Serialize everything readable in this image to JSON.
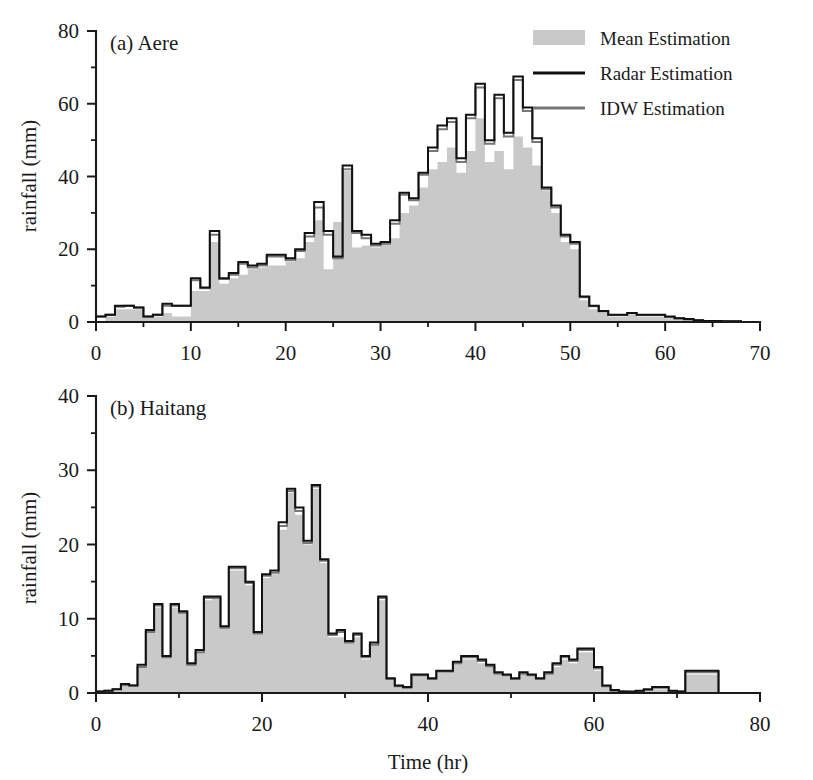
{
  "figure": {
    "width": 813,
    "height": 780,
    "background": "#ffffff",
    "shared_xlabel": "Time (hr)"
  },
  "legend": {
    "position": "top-right-of-panel-a",
    "entries": [
      {
        "label": "Mean Estimation",
        "marker": "filled-swatch",
        "color": "#c9c9c9"
      },
      {
        "label": "Radar Estimation",
        "marker": "line",
        "color": "#111111"
      },
      {
        "label": "IDW Estimation",
        "marker": "line",
        "color": "#777777"
      }
    ]
  },
  "chart_data": [
    {
      "type": "area",
      "panel": "a",
      "title": "(a) Aere",
      "xlabel": "",
      "ylabel": "rainfall (mm)",
      "xlim": [
        0,
        70
      ],
      "ylim": [
        0,
        80
      ],
      "xticks": [
        0,
        10,
        20,
        30,
        40,
        50,
        60,
        70
      ],
      "yticks": [
        0,
        20,
        40,
        60,
        80
      ],
      "xminor_step": 5,
      "yminor_step": 10,
      "grid": false,
      "x": [
        1,
        2,
        3,
        4,
        5,
        6,
        7,
        8,
        9,
        10,
        11,
        12,
        13,
        14,
        15,
        16,
        17,
        18,
        19,
        20,
        21,
        22,
        23,
        24,
        25,
        26,
        27,
        28,
        29,
        30,
        31,
        32,
        33,
        34,
        35,
        36,
        37,
        38,
        39,
        40,
        41,
        42,
        43,
        44,
        45,
        46,
        47,
        48,
        49,
        50,
        51,
        52,
        53,
        54,
        55,
        56,
        57,
        58,
        59,
        60,
        61,
        62,
        63,
        64,
        65,
        66,
        67,
        68,
        69,
        70
      ],
      "series": [
        {
          "name": "Mean Estimation",
          "values": [
            0,
            1.5,
            3.5,
            3.5,
            3.5,
            1.5,
            1.5,
            2.5,
            1.5,
            1.5,
            8.5,
            8.5,
            22.0,
            10.5,
            12.0,
            13.0,
            14.5,
            15.0,
            15.5,
            15.5,
            16.5,
            17.5,
            22.0,
            28.0,
            14.5,
            27.5,
            41.5,
            20.5,
            21.0,
            20.5,
            21.5,
            23.0,
            30.0,
            32.0,
            37.0,
            42.0,
            44.0,
            48.0,
            41.0,
            47.0,
            56.0,
            44.0,
            47.0,
            42.0,
            51.0,
            48.0,
            43.0,
            36.0,
            30.0,
            22.0,
            20.0,
            6.0,
            3.5,
            2.5,
            1.5,
            1.5,
            2.0,
            1.5,
            1.5,
            1.5,
            1.0,
            0.8,
            0.5,
            0.3,
            0.2,
            0.2,
            0.1,
            0.1,
            0.0,
            0.0
          ]
        },
        {
          "name": "Radar Estimation",
          "values": [
            1.5,
            2.0,
            4.5,
            4.5,
            4.0,
            1.5,
            2.0,
            5.0,
            4.5,
            4.5,
            12.0,
            9.5,
            25.0,
            12.0,
            13.5,
            16.5,
            15.5,
            16.0,
            18.5,
            18.5,
            17.5,
            20.0,
            24.5,
            33.0,
            25.0,
            18.0,
            43.0,
            25.0,
            24.0,
            21.5,
            22.0,
            28.0,
            35.5,
            34.0,
            41.0,
            48.0,
            54.0,
            56.0,
            45.0,
            57.0,
            65.5,
            50.0,
            62.5,
            52.0,
            67.5,
            59.0,
            50.5,
            37.0,
            32.0,
            24.0,
            22.0,
            7.0,
            4.5,
            3.0,
            2.0,
            2.0,
            2.5,
            2.0,
            2.0,
            2.0,
            1.5,
            1.0,
            0.8,
            0.5,
            0.3,
            0.3,
            0.2,
            0.2,
            0.0,
            0.0
          ]
        },
        {
          "name": "IDW Estimation",
          "values": [
            1.5,
            2.0,
            4.2,
            4.5,
            4.0,
            1.5,
            2.0,
            4.5,
            4.5,
            4.5,
            11.5,
            9.3,
            24.0,
            11.8,
            13.0,
            16.0,
            15.0,
            15.5,
            18.0,
            18.0,
            17.0,
            19.5,
            23.5,
            31.5,
            24.0,
            17.5,
            42.0,
            24.5,
            23.0,
            21.0,
            21.5,
            27.0,
            35.0,
            33.5,
            40.5,
            47.0,
            53.0,
            55.0,
            44.0,
            56.0,
            64.5,
            49.0,
            61.5,
            51.0,
            66.5,
            58.0,
            49.5,
            36.5,
            31.5,
            23.5,
            21.5,
            6.8,
            4.3,
            2.9,
            1.9,
            1.9,
            2.4,
            1.9,
            1.9,
            1.9,
            1.4,
            1.0,
            0.7,
            0.5,
            0.3,
            0.3,
            0.2,
            0.2,
            0.0,
            0.0
          ]
        }
      ]
    },
    {
      "type": "area",
      "panel": "b",
      "title": "(b) Haitang",
      "xlabel": "Time (hr)",
      "ylabel": "rainfall (mm)",
      "xlim": [
        0,
        80
      ],
      "ylim": [
        0,
        40
      ],
      "xticks": [
        0,
        20,
        40,
        60,
        80
      ],
      "yticks": [
        0,
        10,
        20,
        30,
        40
      ],
      "xminor_step": 10,
      "yminor_step": 5,
      "grid": false,
      "x": [
        1,
        2,
        3,
        4,
        5,
        6,
        7,
        8,
        9,
        10,
        11,
        12,
        13,
        14,
        15,
        16,
        17,
        18,
        19,
        20,
        21,
        22,
        23,
        24,
        25,
        26,
        27,
        28,
        29,
        30,
        31,
        32,
        33,
        34,
        35,
        36,
        37,
        38,
        39,
        40,
        41,
        42,
        43,
        44,
        45,
        46,
        47,
        48,
        49,
        50,
        51,
        52,
        53,
        54,
        55,
        56,
        57,
        58,
        59,
        60,
        61,
        62,
        63,
        64,
        65,
        66,
        67,
        68,
        69,
        70,
        71,
        72,
        73,
        74,
        75,
        76,
        77,
        78,
        79,
        80
      ],
      "series": [
        {
          "name": "Mean Estimation",
          "values": [
            0.0,
            0.2,
            0.3,
            0.8,
            0.8,
            3.5,
            8.5,
            11.5,
            5.0,
            11.5,
            11.0,
            4.0,
            5.5,
            12.5,
            13.0,
            9.0,
            16.5,
            16.5,
            14.5,
            8.0,
            15.5,
            16.0,
            22.0,
            27.0,
            24.0,
            20.0,
            27.5,
            17.5,
            7.5,
            7.5,
            7.0,
            7.5,
            4.5,
            6.5,
            12.5,
            2.0,
            1.0,
            0.8,
            2.5,
            2.5,
            2.0,
            2.8,
            3.0,
            4.0,
            4.5,
            4.5,
            4.0,
            3.5,
            2.5,
            2.5,
            2.0,
            2.5,
            2.5,
            2.0,
            2.5,
            3.5,
            4.5,
            4.0,
            5.5,
            5.5,
            3.0,
            0.8,
            0.3,
            0.2,
            0.1,
            0.2,
            0.3,
            0.5,
            0.5,
            0.3,
            0.2,
            2.5,
            2.5,
            2.5,
            2.5,
            0.0,
            0.0,
            0.0,
            0.0,
            0.0
          ]
        },
        {
          "name": "Radar Estimation",
          "values": [
            0.2,
            0.3,
            0.5,
            1.2,
            1.0,
            3.8,
            8.5,
            12.0,
            5.0,
            12.0,
            11.0,
            4.0,
            5.8,
            13.0,
            13.0,
            9.0,
            17.0,
            17.0,
            15.0,
            8.2,
            16.0,
            16.5,
            23.0,
            27.5,
            25.0,
            20.5,
            28.0,
            18.0,
            8.0,
            8.5,
            7.0,
            8.0,
            5.0,
            6.8,
            13.0,
            2.0,
            1.0,
            0.8,
            2.5,
            2.5,
            2.0,
            3.0,
            3.0,
            4.2,
            5.0,
            5.0,
            4.5,
            3.8,
            2.8,
            2.5,
            2.0,
            2.8,
            2.5,
            2.0,
            2.8,
            4.0,
            5.0,
            4.5,
            6.0,
            6.0,
            3.5,
            1.0,
            0.4,
            0.2,
            0.2,
            0.3,
            0.5,
            0.8,
            0.8,
            0.3,
            0.2,
            3.0,
            3.0,
            3.0,
            3.0,
            0.0,
            0.0,
            0.0,
            0.0,
            0.0
          ]
        },
        {
          "name": "IDW Estimation",
          "values": [
            0.2,
            0.3,
            0.5,
            1.0,
            1.0,
            3.5,
            8.2,
            11.8,
            4.8,
            11.8,
            10.8,
            3.8,
            5.5,
            12.8,
            12.8,
            8.8,
            16.8,
            16.8,
            14.8,
            8.0,
            15.8,
            16.2,
            22.5,
            27.2,
            24.5,
            20.2,
            27.8,
            17.8,
            7.8,
            8.2,
            6.8,
            7.8,
            4.8,
            6.5,
            12.8,
            1.9,
            0.9,
            0.7,
            2.4,
            2.4,
            1.9,
            2.9,
            2.9,
            4.0,
            4.8,
            4.8,
            4.3,
            3.6,
            2.6,
            2.4,
            1.9,
            2.6,
            2.4,
            1.9,
            2.6,
            3.8,
            4.8,
            4.3,
            5.8,
            5.8,
            3.3,
            0.9,
            0.3,
            0.2,
            0.1,
            0.2,
            0.4,
            0.7,
            0.7,
            0.2,
            0.2,
            2.8,
            2.8,
            2.8,
            2.8,
            0.0,
            0.0,
            0.0,
            0.0,
            0.0
          ]
        }
      ]
    }
  ]
}
